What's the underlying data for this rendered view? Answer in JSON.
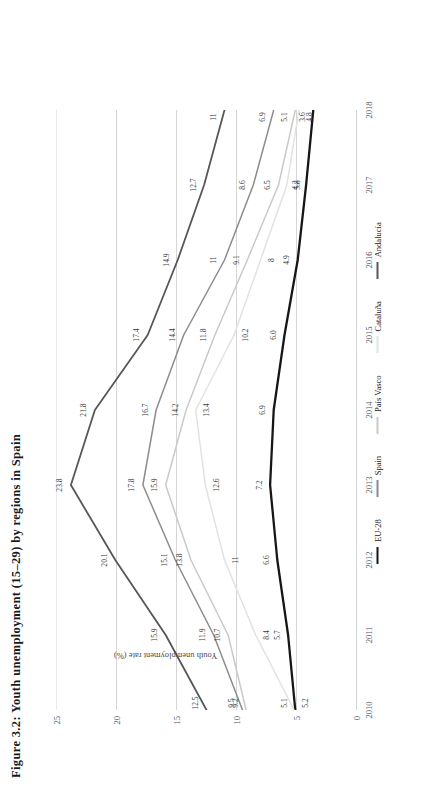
{
  "title": "Figure 3.2: Youth unemployment (15–29) by regions in Spain",
  "axes": {
    "y_title": "Youth unemployment rate (%)",
    "y_ticks": [
      "0",
      "5",
      "10",
      "15",
      "20",
      "25"
    ],
    "x_ticks": [
      "2010",
      "2011",
      "2012",
      "2013",
      "2014",
      "2015",
      "2016",
      "2017",
      "2018"
    ]
  },
  "legend": {
    "items": [
      {
        "label": "EU-28",
        "color": "#161616"
      },
      {
        "label": "Spain",
        "color": "#8c8c8c"
      },
      {
        "label": "País Vasco",
        "color": "#c9c9c9"
      },
      {
        "label": "Cataluña",
        "color": "#e2e2e2"
      },
      {
        "label": "Andalucía",
        "color": "#575757"
      }
    ]
  },
  "chart_data": {
    "type": "line",
    "title": "Figure 3.2: Youth unemployment (15–29) by regions in Spain",
    "xlabel": "",
    "ylabel": "Youth unemployment rate (%)",
    "x": [
      2010,
      2011,
      2012,
      2013,
      2014,
      2015,
      2016,
      2017,
      2018
    ],
    "categories": [
      "2010",
      "2011",
      "2012",
      "2013",
      "2014",
      "2015",
      "2016",
      "2017",
      "2018"
    ],
    "ylim": [
      0,
      25
    ],
    "y_ticks": [
      0,
      5,
      10,
      15,
      20,
      25
    ],
    "grid": true,
    "legend_position": "bottom",
    "series": [
      {
        "name": "EU-28",
        "color": "#161616",
        "width": 2.3,
        "values": [
          5.1,
          5.7,
          6.6,
          7.2,
          6.9,
          6.0,
          4.9,
          4.2,
          3.6
        ],
        "labels": [
          "5.1",
          "5.7",
          "6.6",
          "7.2",
          "6.9",
          "6.0",
          "4.9",
          "4.2",
          "3.6"
        ]
      },
      {
        "name": "Spain",
        "color": "#8c8c8c",
        "width": 1.5,
        "values": [
          9.5,
          11.9,
          15.1,
          17.8,
          16.7,
          14.4,
          11.0,
          8.6,
          6.9
        ],
        "labels": [
          "9.5",
          "11.9",
          "15.1",
          "17.8",
          "16.7",
          "14.4",
          "11",
          "8.6",
          "6.9"
        ]
      },
      {
        "name": "País Vasco",
        "color": "#c9c9c9",
        "width": 1.5,
        "values": [
          9.2,
          10.7,
          13.8,
          15.9,
          14.2,
          11.8,
          9.1,
          6.5,
          5.1
        ],
        "labels": [
          "9.2",
          "10.7",
          "13.8",
          "15.9",
          "14.2",
          "11.8",
          "9.1",
          "6.5",
          "5.1"
        ]
      },
      {
        "name": "Cataluña",
        "color": "#e2e2e2",
        "width": 1.5,
        "values": [
          5.2,
          8.4,
          11.0,
          12.6,
          13.4,
          10.2,
          8.0,
          5.8,
          4.8
        ],
        "labels": [
          "5.2",
          "8.4",
          "11",
          "12.6",
          "13.4",
          "10.2",
          "8",
          "5.8",
          "4.8"
        ]
      },
      {
        "name": "Andalucía",
        "color": "#575757",
        "width": 1.8,
        "values": [
          12.5,
          15.9,
          20.1,
          23.8,
          21.8,
          17.4,
          14.9,
          12.7,
          11.0
        ],
        "labels": [
          "12.5",
          "15.9",
          "20.1",
          "23.8",
          "21.8",
          "17.4",
          "14.9",
          "12.7",
          "11"
        ]
      }
    ]
  }
}
